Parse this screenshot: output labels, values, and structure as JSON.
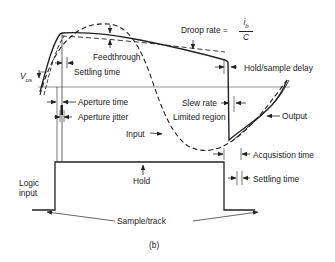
{
  "figure": {
    "caption": "(b)",
    "labels": {
      "droop_rate": "Droop rate =",
      "droop_num_i": "i",
      "droop_num_sub": "b",
      "droop_den": "C",
      "feedthrough": "Feedthrough",
      "settling_time_top": "Settling time",
      "vos_v": "V",
      "vos_sub": "os",
      "hold_sample_delay": "Hold/sample delay",
      "aperture_time": "Aperture time",
      "aperture_jitter": "Aperture jitter",
      "slew_rate": "Slew rate",
      "limited_region": "Limited region",
      "output": "Output",
      "input": "Input",
      "acquisition_time": "Acqusistion time",
      "settling_time_bottom": "Settling time",
      "logic_input_line1": "Logic",
      "logic_input_line2": "input",
      "hold": "Hold",
      "sample_track": "Sample/track"
    },
    "colors": {
      "line": "#222222",
      "baseline": "#666666",
      "background": "#ffffff"
    }
  }
}
